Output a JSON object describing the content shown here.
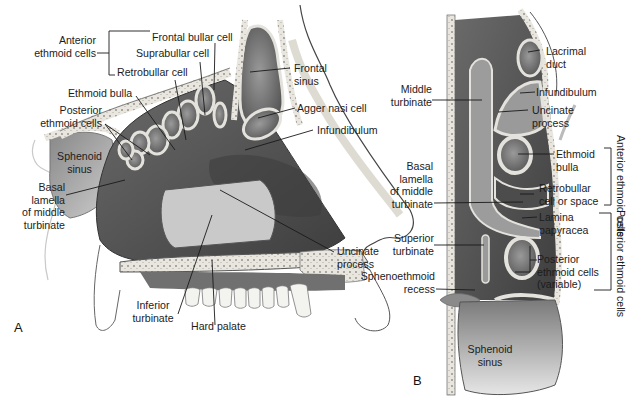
{
  "figure": {
    "panels": [
      {
        "letter": "A",
        "view": "sagittal"
      },
      {
        "letter": "B",
        "view": "axial"
      }
    ]
  },
  "panel_a": {
    "letter": "A",
    "group_label": "Anterior\nethmoid cells",
    "group_line1": "Anterior",
    "group_line2": "ethmoid cells",
    "labels": {
      "frontal_bullar_cell": "Frontal bullar cell",
      "suprabullar_cell": "Suprabullar cell",
      "retrobullar_cell": "Retrobullar cell",
      "ethmoid_bulla": "Ethmoid bulla",
      "posterior_ethmoid_1": "Posterior",
      "posterior_ethmoid_2": "ethmoid cells",
      "sphenoid_sinus_1": "Sphenoid",
      "sphenoid_sinus_2": "sinus",
      "basal_lamella_1": "Basal",
      "basal_lamella_2": "lamella",
      "basal_lamella_3": "of middle",
      "basal_lamella_4": "turbinate",
      "frontal_sinus_1": "Frontal",
      "frontal_sinus_2": "sinus",
      "agger_nasi_cell": "Agger nasi cell",
      "infundibulum": "Infundibulum",
      "uncinate_process_1": "Uncinate",
      "uncinate_process_2": "process",
      "inferior_turbinate_1": "Inferior",
      "inferior_turbinate_2": "turbinate",
      "hard_palate": "Hard palate"
    }
  },
  "panel_b": {
    "letter": "B",
    "labels": {
      "lacrimal_duct_1": "Lacrimal",
      "lacrimal_duct_2": "duct",
      "infundibulum": "Infundibulum",
      "uncinate_process_1": "Uncinate",
      "uncinate_process_2": "process",
      "middle_turbinate_1": "Middle",
      "middle_turbinate_2": "turbinate",
      "ethmoid_bulla_1": "Ethmoid",
      "ethmoid_bulla_2": "bulla",
      "basal_lamella_1": "Basal",
      "basal_lamella_2": "lamella",
      "basal_lamella_3": "of middle",
      "basal_lamella_4": "turbinate",
      "retrobullar_1": "Retrobullar",
      "retrobullar_2": "cell or space",
      "lamina_papyracea_1": "Lamina",
      "lamina_papyracea_2": "papyracea",
      "superior_turbinate_1": "Superior",
      "superior_turbinate_2": "turbinate",
      "posterior_ethmoid_1": "Posterior",
      "posterior_ethmoid_2": "ethmoid cells",
      "posterior_ethmoid_3": "(variable)",
      "sphenoethmoid_recess_1": "Sphenoethmoid",
      "sphenoethmoid_recess_2": "recess",
      "sphenoid_sinus_1": "Sphenoid",
      "sphenoid_sinus_2": "sinus"
    },
    "brackets": {
      "anterior_group": "Anterior ethmoid cells",
      "posterior_group": "Posterior ethmoid cells"
    }
  },
  "colors": {
    "cavity_dark": "#5a5a5a",
    "cavity_mid": "#7d7d7d",
    "bone": "#e4e2dc",
    "soft": "#bdbdbd",
    "line": "#1a1a1a"
  }
}
